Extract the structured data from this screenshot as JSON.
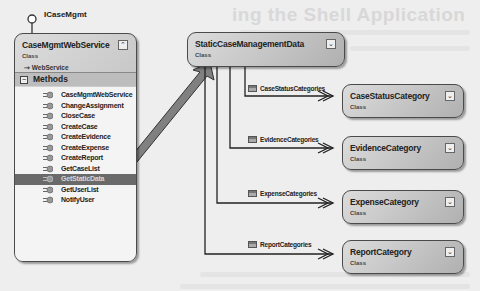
{
  "background": {
    "heading": "ing the Shell Application"
  },
  "interface": {
    "label": "ICaseMgmt"
  },
  "service_class": {
    "name": "CaseMgmtWebService",
    "stereotype": "Class",
    "base": "WebService",
    "toggle_icon": "collapse-icon",
    "compartment": "Methods",
    "methods": [
      "CaseMgmtWebService",
      "ChangeAssignment",
      "CloseCase",
      "CreateCase",
      "CreateEvidence",
      "CreateExpense",
      "CreateReport",
      "GetCaseList",
      "GetStaticData",
      "GetUserList",
      "NotifyUser"
    ],
    "selected_method": "GetStaticData"
  },
  "returns_arrow": {
    "label": "Returns"
  },
  "static_class": {
    "name": "StaticCaseManagementData",
    "stereotype": "Class",
    "toggle_icon": "expand-icon"
  },
  "associations": [
    {
      "label": "CaseStatusCategories",
      "target": {
        "name": "CaseStatusCategory",
        "stereotype": "Class"
      }
    },
    {
      "label": "EvidenceCategories",
      "target": {
        "name": "EvidenceCategory",
        "stereotype": "Class"
      }
    },
    {
      "label": "ExpenseCategories",
      "target": {
        "name": "ExpenseCategory",
        "stereotype": "Class"
      }
    },
    {
      "label": "ReportCategories",
      "target": {
        "name": "ReportCategory",
        "stereotype": "Class"
      }
    }
  ],
  "colors": {
    "shape_fill": "#c4c4c4",
    "shape_border": "#4a4a4a",
    "selected_row": "#6a6a6a",
    "arrow_fill": "#808080"
  }
}
